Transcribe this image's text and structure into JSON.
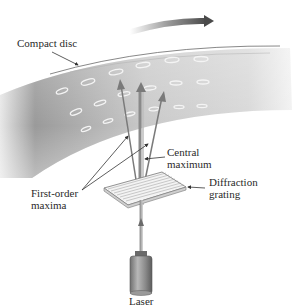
{
  "diagram": {
    "type": "physics-illustration",
    "labels": {
      "compact_disc": "Compact disc",
      "central_maximum_line1": "Central",
      "central_maximum_line2": "maximum",
      "first_order_line1": "First-order",
      "first_order_line2": "maxima",
      "diffraction_grating_line1": "Diffraction",
      "diffraction_grating_line2": "grating",
      "laser": "Laser"
    },
    "elements": [
      "rotation-arrow",
      "compact-disc-surface",
      "disc-pits",
      "laser",
      "diffraction-grating",
      "central-maximum-beam",
      "first-order-maxima-beams"
    ],
    "colors": {
      "disc_dark": "#8c8c8c",
      "disc_light": "#e6e6e6",
      "arrow": "#555555",
      "beam": "#7a7a7a",
      "text": "#2a2a2a"
    }
  }
}
